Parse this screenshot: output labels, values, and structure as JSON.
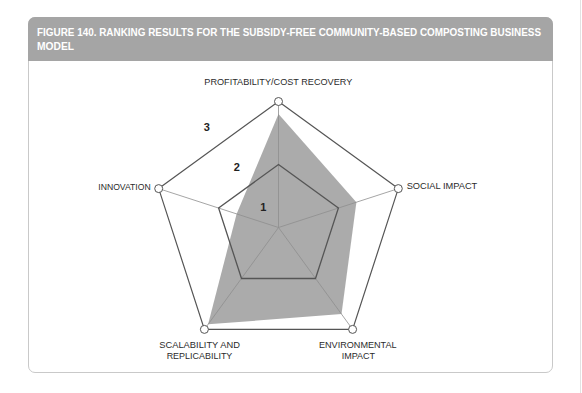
{
  "figure": {
    "title_line1": "FIGURE 140.  RANKING RESULTS FOR THE SUBSIDY-FREE COMMUNITY-BASED COMPOSTING BUSINESS",
    "title_line2": "MODEL"
  },
  "axis_label_lines": {
    "top": "PROFITABILITY/COST RECOVERY",
    "right": "SOCIAL IMPACT",
    "bottom_right_1": "ENVIRONMENTAL",
    "bottom_right_2": "IMPACT",
    "bottom_left_1": "SCALABILITY AND",
    "bottom_left_2": "REPLICABILITY",
    "left": "INNOVATION"
  },
  "chart_data": {
    "type": "radar",
    "title": "FIGURE 140. RANKING RESULTS FOR THE SUBSIDY-FREE COMMUNITY-BASED COMPOSTING BUSINESS MODEL",
    "axes": [
      "PROFITABILITY/COST RECOVERY",
      "SOCIAL IMPACT",
      "ENVIRONMENTAL IMPACT",
      "SCALABILITY AND REPLICABILITY",
      "INNOVATION"
    ],
    "series": [
      {
        "name": "Subsidy-free community-based composting",
        "values": [
          2.8,
          2.3,
          2.7,
          2.9,
          1.7
        ]
      }
    ],
    "range": [
      1,
      3
    ],
    "grid_levels": [
      2,
      3
    ],
    "scale_labels": [
      "1",
      "2",
      "3"
    ],
    "grid": true,
    "legend": "none",
    "colors": {
      "fill": "#ababab",
      "grid": "#555555",
      "axis": "#8e8e8e",
      "header": "#a5a5a5"
    }
  }
}
